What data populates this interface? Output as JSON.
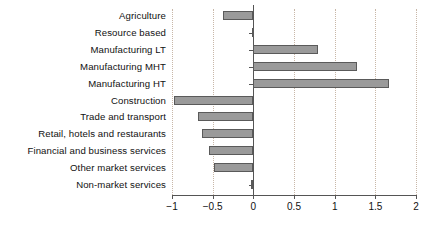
{
  "chart_data": {
    "type": "bar",
    "orientation": "horizontal",
    "title": "",
    "subtitle": "",
    "xlabel": "",
    "ylabel": "",
    "xlim": [
      -1,
      2
    ],
    "xticks": [
      -1,
      -0.5,
      0,
      0.5,
      1,
      1.5,
      2
    ],
    "xtick_labels": [
      "−1",
      "−0.5",
      "0",
      "0.5",
      "1",
      "1.5",
      "2"
    ],
    "grid": true,
    "grid_axis": "x",
    "legend": null,
    "categories": [
      "Agriculture",
      "Resource based",
      "Manufacturing LT",
      "Manufacturing MHT",
      "Manufacturing HT",
      "Construction",
      "Trade and transport",
      "Retail, hotels and restaurants",
      "Financial and business services",
      "Other market services",
      "Non-market services"
    ],
    "values": [
      -0.37,
      -0.02,
      0.8,
      1.27,
      1.67,
      -0.97,
      -0.68,
      -0.63,
      -0.55,
      -0.48,
      -0.03
    ],
    "bar_fill_color": "#9a9a9a",
    "bar_edge_color": "#5a5a5a",
    "grid_color": "#c8b7a8",
    "axis_color": "#555555"
  }
}
